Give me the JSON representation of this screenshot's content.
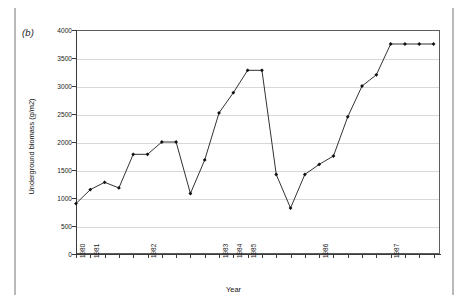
{
  "figure": {
    "panel_label": "(b)"
  },
  "chart_data": {
    "type": "line",
    "title": "",
    "xlabel": "Year",
    "ylabel": "Underground biomass (g/m2)",
    "ylim": [
      0,
      4000
    ],
    "y_ticks": [
      0,
      500,
      1000,
      1500,
      2000,
      2500,
      3000,
      3500,
      4000
    ],
    "y_tick_labels": [
      "0",
      "500",
      "1000",
      "1500",
      "2000",
      "2500",
      "3000",
      "3500",
      "4000"
    ],
    "grid": "horizontal",
    "legend": "none",
    "marker": "filled-diamond",
    "x_tick_labels": [
      "1980",
      "1981",
      "1982",
      "1983",
      "1984",
      "1985",
      "1986",
      "1987"
    ],
    "x_tick_positions": [
      0,
      1,
      5,
      10,
      11,
      12,
      17,
      22
    ],
    "x_minor_tick_positions": [
      0,
      1,
      2,
      3,
      4,
      5,
      6,
      7,
      8,
      9,
      10,
      11,
      12,
      13,
      14,
      15,
      16,
      17,
      18,
      19,
      20,
      21,
      22,
      23,
      24,
      25
    ],
    "x": [
      0,
      1,
      2,
      3,
      4,
      5,
      6,
      7,
      8,
      9,
      10,
      11,
      12,
      13,
      14,
      15,
      16,
      17,
      18,
      19,
      20,
      21,
      22,
      23,
      24,
      25
    ],
    "values": [
      900,
      1150,
      1280,
      1180,
      1780,
      1780,
      2000,
      2000,
      1080,
      1680,
      2520,
      2880,
      3280,
      3280,
      1420,
      820,
      1420,
      1600,
      1750,
      2450,
      3000,
      3200,
      3750,
      3750,
      3750,
      3750
    ],
    "series": [
      {
        "name": "Underground biomass",
        "values": [
          900,
          1150,
          1280,
          1180,
          1780,
          1780,
          2000,
          2000,
          1080,
          1680,
          2520,
          2880,
          3280,
          3280,
          1420,
          820,
          1420,
          1600,
          1750,
          2450,
          3000,
          3200,
          3750,
          3750,
          3750,
          3750
        ]
      }
    ]
  }
}
